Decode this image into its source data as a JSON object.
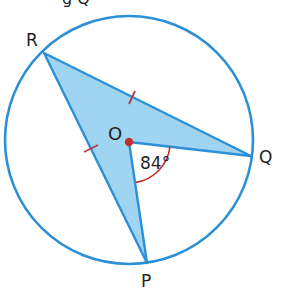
{
  "diagram": {
    "type": "circle-geometry",
    "center_label": "O",
    "points": [
      {
        "label": "R",
        "x": 44,
        "y": 53
      },
      {
        "label": "Q",
        "x": 251,
        "y": 156
      },
      {
        "label": "P",
        "x": 147,
        "y": 263
      },
      {
        "label": "O",
        "x": 129,
        "y": 142
      }
    ],
    "circle": {
      "cx": 129,
      "cy": 140,
      "r": 124
    },
    "angle": {
      "vertex": "O",
      "between": [
        "Q",
        "P"
      ],
      "value": "84°"
    },
    "equal_marks": [
      "OR",
      "OQ"
    ],
    "top_fragment": "g  Q",
    "colors": {
      "circle": "#2d8fd5",
      "fill": "#9fd5f2",
      "edge": "#2d8fd5",
      "center_dot": "#c0312b",
      "angle_arc": "#c0312b",
      "tick": "#b23a48",
      "text": "#231f20"
    }
  }
}
